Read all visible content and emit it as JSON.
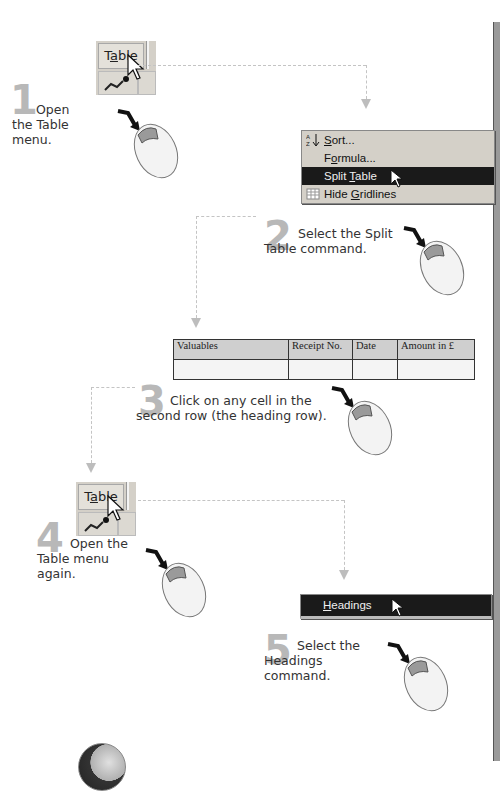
{
  "steps": [
    {
      "number": "1",
      "text_line1": "Open",
      "text_line2": "the Table",
      "text_line3": "menu."
    },
    {
      "number": "2",
      "text_line1": "Select the Split",
      "text_line2": "Table command."
    },
    {
      "number": "3",
      "text_line1": "Click on any cell in the",
      "text_line2": "second row (the heading row)."
    },
    {
      "number": "4",
      "text_line1": "Open the",
      "text_line2": "Table menu",
      "text_line3": "again."
    },
    {
      "number": "5",
      "text_line1": "Select the",
      "text_line2": "Headings",
      "text_line3": "command."
    }
  ],
  "table_button": {
    "label_pre": "T",
    "label_ul": "a",
    "label_post": "ble"
  },
  "table_menu": {
    "items": [
      {
        "pre": "",
        "ul": "S",
        "post": "ort...",
        "icon": "sort-az-icon",
        "highlighted": false
      },
      {
        "pre": "F",
        "ul": "o",
        "post": "rmula...",
        "icon": "",
        "highlighted": false
      },
      {
        "pre": "Split ",
        "ul": "T",
        "post": "able",
        "icon": "",
        "highlighted": true
      },
      {
        "pre": "Hide ",
        "ul": "G",
        "post": "ridlines",
        "icon": "gridlines-icon",
        "highlighted": false
      }
    ]
  },
  "word_table": {
    "headers": [
      "Valuables",
      "Receipt No.",
      "Date",
      "Amount in £"
    ],
    "rows": [
      [
        "",
        "",
        "",
        ""
      ]
    ]
  },
  "headings_menu": {
    "pre": "",
    "ul": "H",
    "post": "eadings"
  },
  "colors": {
    "step_number": "#b8b8b8",
    "menu_bg": "#d4d0c8",
    "menu_highlight": "#1a1a1a",
    "table_header_bg": "#cfcfcf",
    "dash_line": "#c4c4c4"
  }
}
